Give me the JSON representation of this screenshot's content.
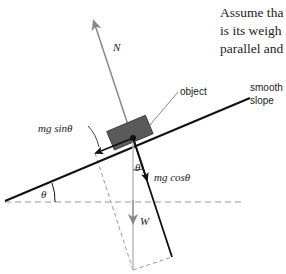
{
  "diagram": {
    "labels": {
      "normal_force": "N",
      "object": "object",
      "slope_line1": "smooth",
      "slope_line2": "slope",
      "parallel_component": "mg sinθ",
      "perpendicular_component": "mg cosθ",
      "weight": "W",
      "angle_slope": "θ",
      "angle_weight": "θ"
    },
    "colors": {
      "force_gray": "#888888",
      "line_black": "#111111",
      "block_fill": "#5a5a5a",
      "dashed": "#999999"
    }
  },
  "body_text": {
    "lines": [
      "Assume tha",
      "is its weigh",
      "parallel and"
    ]
  }
}
